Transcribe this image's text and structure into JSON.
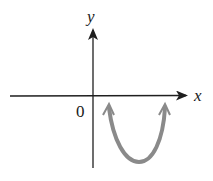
{
  "diagram": {
    "type": "coordinate-plane-sketch",
    "axes": {
      "x_label": "x",
      "y_label": "y",
      "origin_label": "0",
      "axis_color": "#1f1f1f"
    },
    "curve": {
      "description": "upward-opening parabola in fourth quadrant, both ends with arrowheads pointing up",
      "color": "#8a8a8a",
      "vertex_px": [
        139,
        162
      ],
      "left_end_px": [
        109,
        105
      ],
      "right_end_px": [
        165,
        105
      ]
    }
  }
}
